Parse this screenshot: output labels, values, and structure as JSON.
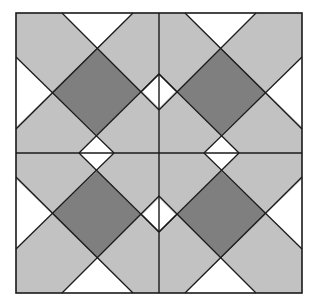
{
  "diagram": {
    "type": "quilt-block-pattern",
    "layout": "2x2 repeated blocks, mirrored about the center",
    "colors": {
      "light": "#c2c2c2",
      "dark": "#7f7f7f",
      "white": "#ffffff",
      "line": "#1a1a1a"
    },
    "frame": {
      "x": 16,
      "y": 13,
      "width": 286,
      "height": 280
    },
    "center": {
      "x": 159,
      "y": 153
    },
    "blocks": [
      {
        "name": "top-left",
        "dark_square": true
      },
      {
        "name": "top-right",
        "dark_square": true
      },
      {
        "name": "bottom-left",
        "dark_square": true
      },
      {
        "name": "bottom-right",
        "dark_square": true
      }
    ]
  }
}
